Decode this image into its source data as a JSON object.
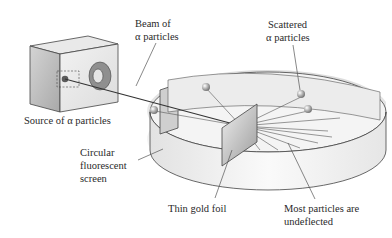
{
  "figure": {
    "labels": {
      "beam": [
        "Beam of",
        "α particles"
      ],
      "scattered": [
        "Scattered",
        "α particles"
      ],
      "source": "Source of α particles",
      "screen": [
        "Circular",
        "fluorescent",
        "screen"
      ],
      "foil": "Thin gold foil",
      "undeflected": [
        "Most particles are",
        "undeflected"
      ]
    }
  }
}
